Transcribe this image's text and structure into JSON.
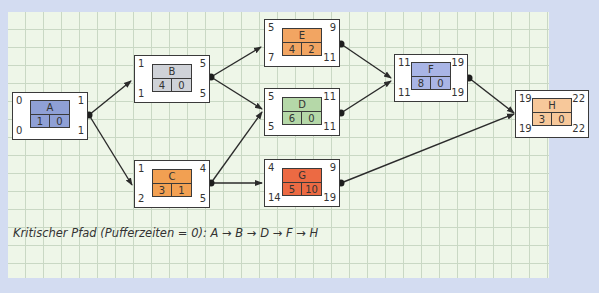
{
  "diagram": {
    "type": "network-plan",
    "caption": "Kritischer Pfad (Pufferzeiten = 0): A → B → D → F → H",
    "nodes": [
      {
        "id": "A",
        "faz": "0",
        "fez": "1",
        "saz": "0",
        "sez": "1",
        "dauer": "1",
        "puffer": "0",
        "color": "#8fa0d6"
      },
      {
        "id": "B",
        "faz": "1",
        "fez": "5",
        "saz": "1",
        "sez": "5",
        "dauer": "4",
        "puffer": "0",
        "color": "#cfd2d8"
      },
      {
        "id": "C",
        "faz": "1",
        "fez": "4",
        "saz": "2",
        "sez": "5",
        "dauer": "3",
        "puffer": "1",
        "color": "#f2a052"
      },
      {
        "id": "E",
        "faz": "5",
        "fez": "9",
        "saz": "7",
        "sez": "11",
        "dauer": "4",
        "puffer": "2",
        "color": "#f2a562"
      },
      {
        "id": "D",
        "faz": "5",
        "fez": "11",
        "saz": "5",
        "sez": "11",
        "dauer": "6",
        "puffer": "0",
        "color": "#b5d8a8"
      },
      {
        "id": "G",
        "faz": "4",
        "fez": "9",
        "saz": "14",
        "sez": "19",
        "dauer": "5",
        "puffer": "10",
        "color": "#ec6a43"
      },
      {
        "id": "F",
        "faz": "11",
        "fez": "19",
        "saz": "11",
        "sez": "19",
        "dauer": "8",
        "puffer": "0",
        "color": "#a9b5e6"
      },
      {
        "id": "H",
        "faz": "19",
        "fez": "22",
        "saz": "19",
        "sez": "22",
        "dauer": "3",
        "puffer": "0",
        "color": "#f7c89a"
      }
    ],
    "edges": [
      [
        "A",
        "B"
      ],
      [
        "A",
        "C"
      ],
      [
        "B",
        "E"
      ],
      [
        "B",
        "D"
      ],
      [
        "C",
        "D"
      ],
      [
        "C",
        "G"
      ],
      [
        "E",
        "F"
      ],
      [
        "D",
        "F"
      ],
      [
        "F",
        "H"
      ],
      [
        "G",
        "H"
      ]
    ],
    "critical_path": [
      "A",
      "B",
      "D",
      "F",
      "H"
    ]
  }
}
